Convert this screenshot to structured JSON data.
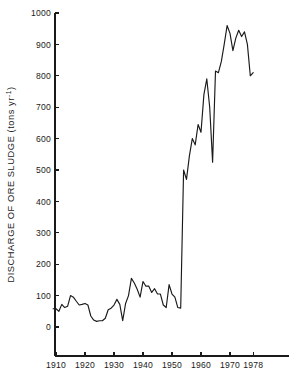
{
  "chart_data": {
    "type": "line",
    "title": "",
    "xlabel": "",
    "ylabel": "DISCHARGE OF ORE SLUDGE (tons yr",
    "ylabel_exponent": "-1",
    "ylabel_close": ")",
    "xlim": [
      1908,
      1979
    ],
    "ylim": [
      0,
      1000
    ],
    "grid": false,
    "legend": null,
    "xticks": [
      1910,
      1920,
      1930,
      1940,
      1950,
      1960,
      1970,
      1978
    ],
    "xtick_labels": [
      "1910",
      "1920",
      "1930",
      "1940",
      "1950",
      "1960",
      "1970",
      "1978"
    ],
    "yticks": [
      0,
      100,
      200,
      300,
      400,
      500,
      600,
      700,
      800,
      900,
      1000
    ],
    "ytick_labels": [
      "0",
      "100",
      "200",
      "300",
      "400",
      "500",
      "600",
      "700",
      "800",
      "900",
      "1000"
    ],
    "line_color": "#1a1a1a",
    "series": [
      {
        "name": "Discharge of ore sludge",
        "x": [
          1909,
          1910,
          1911,
          1912,
          1913,
          1914,
          1915,
          1916,
          1917,
          1918,
          1919,
          1920,
          1921,
          1922,
          1923,
          1924,
          1925,
          1926,
          1927,
          1928,
          1929,
          1930,
          1931,
          1932,
          1933,
          1934,
          1935,
          1936,
          1937,
          1938,
          1939,
          1940,
          1941,
          1942,
          1943,
          1944,
          1945,
          1946,
          1947,
          1948,
          1949,
          1950,
          1951,
          1952,
          1953,
          1954,
          1955,
          1956,
          1957,
          1958,
          1959,
          1960,
          1961,
          1962,
          1963,
          1964,
          1965,
          1966,
          1967,
          1968,
          1969,
          1970,
          1971,
          1972,
          1973,
          1974,
          1975,
          1976,
          1977,
          1978
        ],
        "values": [
          58,
          58,
          50,
          72,
          62,
          66,
          100,
          95,
          82,
          70,
          72,
          75,
          70,
          35,
          22,
          18,
          20,
          20,
          28,
          55,
          60,
          70,
          88,
          72,
          20,
          75,
          100,
          155,
          140,
          120,
          95,
          145,
          130,
          130,
          110,
          122,
          105,
          105,
          70,
          62,
          135,
          105,
          95,
          62,
          60,
          500,
          470,
          545,
          600,
          580,
          645,
          620,
          740,
          790,
          700,
          525,
          815,
          810,
          845,
          900,
          960,
          935,
          880,
          920,
          945,
          925,
          940,
          900,
          800,
          810
        ]
      }
    ]
  }
}
